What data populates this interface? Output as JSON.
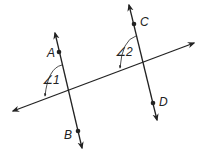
{
  "diagram": {
    "type": "geometry",
    "colors": {
      "line": "#222222",
      "background": "#ffffff"
    },
    "points": {
      "A": {
        "label": "A",
        "x": 59,
        "y": 52
      },
      "B": {
        "label": "B",
        "x": 78,
        "y": 131
      },
      "C": {
        "label": "C",
        "x": 134,
        "y": 24
      },
      "D": {
        "label": "D",
        "x": 153,
        "y": 103
      }
    },
    "angles": {
      "angle1": {
        "label": "∠1"
      },
      "angle2": {
        "label": "∠2"
      }
    },
    "lines": [
      {
        "name": "line-AB",
        "from": [
          55,
          33
        ],
        "to": [
          82,
          148
        ]
      },
      {
        "name": "line-CD",
        "from": [
          129,
          5
        ],
        "to": [
          157,
          120
        ]
      },
      {
        "name": "transversal",
        "from": [
          13,
          111
        ],
        "to": [
          194,
          43
        ]
      }
    ]
  }
}
